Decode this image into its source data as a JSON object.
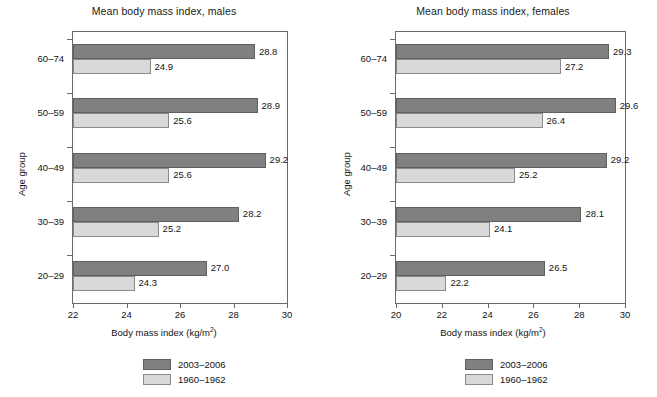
{
  "chart_data": [
    {
      "type": "bar",
      "orientation": "horizontal",
      "title": "Mean body mass index, males",
      "xlabel": "Body mass index (kg/m2)",
      "xlabel_base": "Body mass index (kg/m",
      "xlabel_sup": "2",
      "xlabel_tail": ")",
      "ylabel": "Age group",
      "categories": [
        "60–74",
        "50–59",
        "40–49",
        "30–39",
        "20–29"
      ],
      "series": [
        {
          "name": "2003–2006",
          "color": "#808080",
          "values": [
            28.8,
            28.9,
            29.2,
            28.2,
            27.0
          ]
        },
        {
          "name": "1960–1962",
          "color": "#d9d9d9",
          "values": [
            24.9,
            25.6,
            25.6,
            25.2,
            24.3
          ]
        }
      ],
      "value_labels": {
        "2003–2006": [
          "28.8",
          "28.9",
          "29.2",
          "28.2",
          "27.0"
        ],
        "1960–1962": [
          "24.9",
          "25.6",
          "25.6",
          "25.2",
          "24.3"
        ]
      },
      "xlim": [
        22,
        30
      ],
      "xticks": [
        22,
        24,
        26,
        28,
        30
      ],
      "xticklabels": [
        "22",
        "24",
        "26",
        "28",
        "30"
      ],
      "grid": false,
      "legend_position": "bottom-center"
    },
    {
      "type": "bar",
      "orientation": "horizontal",
      "title": "Mean body mass index, females",
      "xlabel": "Body mass index (kg/m2)",
      "xlabel_base": "Body mass index (kg/m",
      "xlabel_sup": "2",
      "xlabel_tail": ")",
      "ylabel": "Age group",
      "categories": [
        "60–74",
        "50–59",
        "40–49",
        "30–39",
        "20–29"
      ],
      "series": [
        {
          "name": "2003–2006",
          "color": "#808080",
          "values": [
            29.3,
            29.6,
            29.2,
            28.1,
            26.5
          ]
        },
        {
          "name": "1960–1962",
          "color": "#d9d9d9",
          "values": [
            27.2,
            26.4,
            25.2,
            24.1,
            22.2
          ]
        }
      ],
      "value_labels": {
        "2003–2006": [
          "29.3",
          "29.6",
          "29.2",
          "28.1",
          "26.5"
        ],
        "1960–1962": [
          "27.2",
          "26.4",
          "25.2",
          "24.1",
          "22.2"
        ]
      },
      "xlim": [
        20,
        30
      ],
      "xticks": [
        20,
        22,
        24,
        26,
        28,
        30
      ],
      "xticklabels": [
        "20",
        "22",
        "24",
        "26",
        "28",
        "30"
      ],
      "grid": false,
      "legend_position": "bottom-center"
    }
  ],
  "colors": {
    "recent": "#808080",
    "old": "#d9d9d9",
    "axis": "#6a6a6a",
    "text": "#141414",
    "background": "#ffffff"
  }
}
